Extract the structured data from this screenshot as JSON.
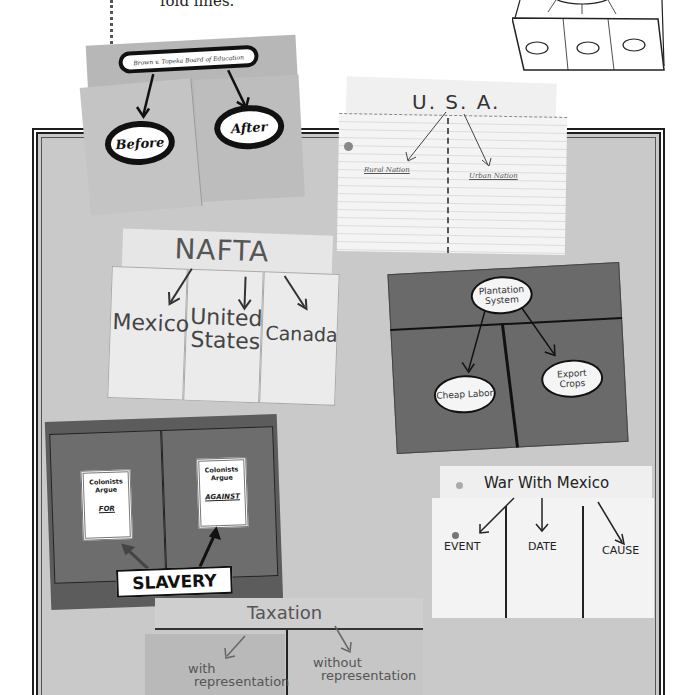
{
  "caption": {
    "text": "fold lines."
  },
  "diagram": {
    "name": "three-tab-foldable-diagram"
  },
  "foldables": {
    "brown_v_board": {
      "title": "Brown v. Topeka Board of Education",
      "left": "Before",
      "right": "After"
    },
    "usa": {
      "title": "U. S. A.",
      "left": "Rural Nation",
      "right": "Urban Nation"
    },
    "nafta": {
      "title": "NAFTA",
      "tabs": [
        "Mexico",
        "United States",
        "Canada"
      ]
    },
    "plantation": {
      "title": "Plantation System",
      "left": "Cheap Labor",
      "right": "Export Crops"
    },
    "slavery": {
      "label": "SLAVERY",
      "left_card": {
        "line1": "Colonists",
        "line2": "Argue",
        "emph": "FOR"
      },
      "right_card": {
        "line1": "Colonists",
        "line2": "Argue",
        "emph": "AGAINST"
      }
    },
    "war_with_mexico": {
      "title": "War With Mexico",
      "columns": [
        "EVENT",
        "DATE",
        "CAUSE"
      ]
    },
    "taxation": {
      "title": "Taxation",
      "left": {
        "line1": "with",
        "line2": "representation"
      },
      "right": {
        "line1": "without",
        "line2": "representation"
      }
    }
  }
}
